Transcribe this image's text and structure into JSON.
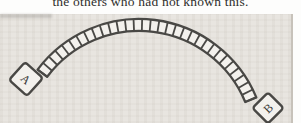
{
  "caption": {
    "text": "the others who had not known this."
  },
  "figure": {
    "colors": {
      "ink": "#49484565",
      "ink_stroke": "#494845",
      "cell_fill": "#f3f1ed",
      "panel_bg": "#e8e5e0",
      "letter": "#3b3a38"
    },
    "arc": {
      "cx": 139,
      "cy": 132,
      "r_outer": 127,
      "r_inner": 115,
      "angle_start": -143,
      "angle_end": -22.5,
      "cells": 31
    },
    "tiles": [
      {
        "label": "A",
        "x": 26,
        "y": 65,
        "size": 24,
        "rotation": 42
      },
      {
        "label": "B",
        "x": 268,
        "y": 94,
        "size": 22,
        "rotation": -45
      }
    ]
  }
}
